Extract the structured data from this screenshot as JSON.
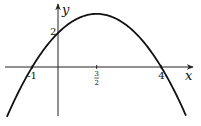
{
  "chart_data": {
    "type": "line",
    "title": "",
    "function": "y = -1/2 (x + 1)(x - 4)",
    "coefficients": {
      "a": -0.5,
      "b": 1.5,
      "c": 2
    },
    "xlabel": "x",
    "ylabel": "y",
    "xlim": [
      -2.05,
      5.2
    ],
    "ylim": [
      -2.9,
      3.6
    ],
    "grid": false,
    "x_ticks": [
      {
        "value": -1,
        "label": "-1"
      },
      {
        "value": 1.5,
        "label_num": "3",
        "label_den": "2"
      },
      {
        "value": 4,
        "label": "4"
      }
    ],
    "y_ticks": [
      {
        "value": 2,
        "label": "2"
      }
    ],
    "key_points": {
      "x_intercepts": [
        -1,
        4
      ],
      "y_intercept": 2,
      "vertex": [
        1.5,
        3.125
      ]
    },
    "curve_domain": [
      -1.98,
      4.96
    ]
  }
}
